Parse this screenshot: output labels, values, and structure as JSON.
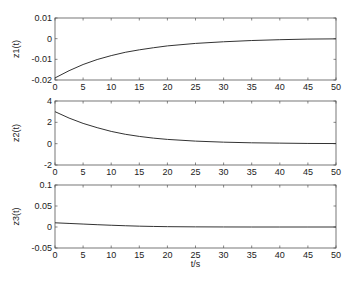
{
  "figure": {
    "xlabel": "t/s",
    "background": "#ffffff",
    "line_color": "#333333",
    "axes_color": "#555555"
  },
  "chart_data": [
    {
      "type": "line",
      "title": "",
      "xlabel": "",
      "ylabel": "z1(t)",
      "xlim": [
        0,
        50
      ],
      "ylim": [
        -0.02,
        0.01
      ],
      "xticks": [
        0,
        5,
        10,
        15,
        20,
        25,
        30,
        35,
        40,
        45,
        50
      ],
      "yticks": [
        -0.02,
        -0.01,
        0,
        0.01
      ],
      "ytick_labels": [
        "-0.02",
        "-0.01",
        "0",
        "0.01"
      ],
      "grid": false,
      "series": [
        {
          "name": "z1(t)",
          "x": [
            0,
            2.5,
            5,
            7.5,
            10,
            12.5,
            15,
            17.5,
            20,
            25,
            30,
            35,
            40,
            45,
            50
          ],
          "values": [
            -0.019,
            -0.0155,
            -0.0125,
            -0.0101,
            -0.0082,
            -0.0066,
            -0.0054,
            -0.0044,
            -0.0035,
            -0.0023,
            -0.0015,
            -0.0009,
            -0.0005,
            -0.0002,
            -0.0001
          ]
        }
      ]
    },
    {
      "type": "line",
      "title": "",
      "xlabel": "",
      "ylabel": "z2(t)",
      "xlim": [
        0,
        50
      ],
      "ylim": [
        -2,
        4
      ],
      "xticks": [
        0,
        5,
        10,
        15,
        20,
        25,
        30,
        35,
        40,
        45,
        50
      ],
      "yticks": [
        -2,
        0,
        2,
        4
      ],
      "ytick_labels": [
        "-2",
        "0",
        "2",
        "4"
      ],
      "grid": false,
      "series": [
        {
          "name": "z2(t)",
          "x": [
            0,
            2.5,
            5,
            7.5,
            10,
            12.5,
            15,
            17.5,
            20,
            25,
            30,
            35,
            40,
            45,
            50
          ],
          "values": [
            3.0,
            2.4,
            1.9,
            1.5,
            1.15,
            0.88,
            0.68,
            0.52,
            0.4,
            0.24,
            0.14,
            0.08,
            0.05,
            0.02,
            0.01
          ]
        }
      ]
    },
    {
      "type": "line",
      "title": "",
      "xlabel": "t/s",
      "ylabel": "z3(t)",
      "xlim": [
        0,
        50
      ],
      "ylim": [
        -0.05,
        0.1
      ],
      "xticks": [
        0,
        5,
        10,
        15,
        20,
        25,
        30,
        35,
        40,
        45,
        50
      ],
      "yticks": [
        -0.05,
        0,
        0.05,
        0.1
      ],
      "ytick_labels": [
        "-0.05",
        "0",
        "0.05",
        "0.1"
      ],
      "grid": false,
      "series": [
        {
          "name": "z3(t)",
          "x": [
            0,
            2.5,
            5,
            7.5,
            10,
            12.5,
            15,
            17.5,
            20,
            25,
            30,
            35,
            40,
            45,
            50
          ],
          "values": [
            0.01,
            0.0085,
            0.007,
            0.0055,
            0.0042,
            0.003,
            0.002,
            0.0013,
            0.0008,
            0.0003,
            0.0001,
            0.0,
            0.0,
            0.0,
            0.0
          ]
        }
      ]
    }
  ]
}
